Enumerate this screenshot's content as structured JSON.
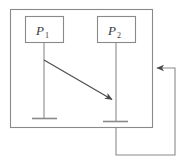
{
  "diagram": {
    "type": "sequence-diagram",
    "stroke_color": "#7a7a7a",
    "text_color": "#3a3a3a",
    "background_color": "#ffffff",
    "canvas": {
      "width": 185,
      "height": 162
    },
    "outer_boundary": {
      "name": "system-boundary",
      "x": 10,
      "y": 9,
      "width": 142,
      "height": 118
    },
    "processes": [
      {
        "id": "p1",
        "label": "P",
        "subscript": "1",
        "box": {
          "x": 25,
          "y": 16,
          "width": 38,
          "height": 26
        },
        "lifeline": {
          "x": 44,
          "y_top": 42,
          "y_bottom": 118
        },
        "terminator": {
          "x_start": 32,
          "x_end": 57,
          "y": 118
        }
      },
      {
        "id": "p2",
        "label": "P",
        "subscript": "2",
        "box": {
          "x": 97,
          "y": 16,
          "width": 38,
          "height": 26
        },
        "lifeline": {
          "x": 116,
          "y_top": 42,
          "y_bottom": 121
        },
        "terminator": {
          "x_start": 103,
          "x_end": 128,
          "y": 121
        }
      }
    ],
    "messages": [
      {
        "name": "message-arrow-p1-to-p2",
        "from": "p1",
        "to": "p2",
        "x1": 44,
        "y1": 60,
        "x2": 115,
        "y2": 101,
        "arrowhead": "filled-triangle"
      }
    ],
    "feedback": {
      "name": "feedback-loop",
      "description": "Loop from P2 lifeline bottom around right side back into boundary",
      "points": "116,127 116,155 175,155 175,68 154,68",
      "arrowhead": "filled-triangle",
      "arrow_target_x": 153,
      "arrow_target_y": 68
    }
  }
}
